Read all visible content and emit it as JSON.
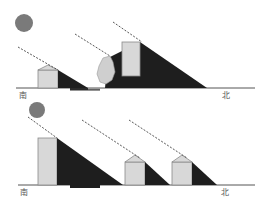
{
  "colors": {
    "sun": "#7a7a7a",
    "shadow": "#1e1e1e",
    "building": "#d8d8d8",
    "building_stroke": "#8a8a8a",
    "ground": "#555555",
    "sun_ray": "#444444",
    "tree": "#cfcfcf"
  },
  "panels": [
    {
      "id": "top",
      "south_label": "南",
      "north_label": "北",
      "description": "Low sun: tall building in the north, tree and small house in the south"
    },
    {
      "id": "bottom",
      "south_label": "南",
      "north_label": "北",
      "description": "Tall building in the south casting long shadow; two small houses to the north"
    }
  ]
}
